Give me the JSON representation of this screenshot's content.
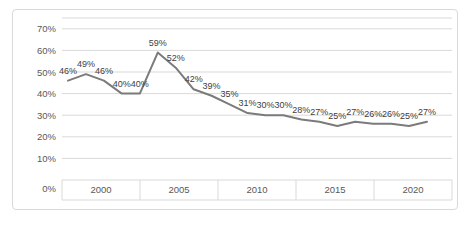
{
  "chart_data": {
    "type": "line",
    "title": "",
    "legend": "none",
    "grid": "horizontal",
    "series": [
      {
        "name": "percent-series",
        "values": [
          46,
          49,
          46,
          40,
          40,
          59,
          52,
          42,
          39,
          35,
          31,
          30,
          30,
          28,
          27,
          25,
          27,
          26,
          26,
          25,
          27
        ]
      }
    ],
    "data_labels": [
      "46%",
      "49%",
      "46%",
      "40%",
      "40%",
      "59%",
      "52%",
      "42%",
      "39%",
      "35%",
      "31%",
      "30%",
      "30%",
      "28%",
      "27%",
      "25%",
      "27%",
      "26%",
      "26%",
      "25%",
      "27%"
    ],
    "x_tick_labels": [
      "2000",
      "2005",
      "2010",
      "2015",
      "2020"
    ],
    "y_tick_labels": [
      "70%",
      "60%",
      "50%",
      "40%",
      "30%",
      "20%",
      "10%",
      "0%"
    ],
    "ylim": [
      0,
      75
    ],
    "y_major_unit": 10
  },
  "style": {
    "background": "#ffffff",
    "border_color": "#d9d9d9",
    "gridline_color": "#d9d9d9",
    "line_color": "#7b7b7b",
    "data_label_color": "#404040",
    "axis_label_color": "#595959"
  }
}
